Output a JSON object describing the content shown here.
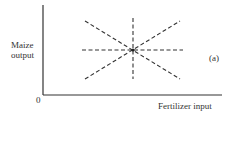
{
  "figure": {
    "y_axis_label_line1": "Maize",
    "y_axis_label_line2": "output",
    "x_axis_label": "Fertilizer input",
    "origin_label": "0",
    "panel_label": "(a)"
  },
  "diagram": {
    "type": "isoquant-star",
    "center": {
      "x": 133,
      "y": 50
    },
    "lines": [
      {
        "name": "vertical",
        "x1": 133,
        "y1": 18,
        "x2": 133,
        "y2": 79
      },
      {
        "name": "horizontal",
        "x1": 82,
        "y1": 50,
        "x2": 183,
        "y2": 50
      },
      {
        "name": "diagonal-down",
        "x1": 85,
        "y1": 21,
        "x2": 180,
        "y2": 79
      },
      {
        "name": "diagonal-up",
        "x1": 85,
        "y1": 79,
        "x2": 180,
        "y2": 21
      }
    ],
    "line_color": "#333333"
  }
}
